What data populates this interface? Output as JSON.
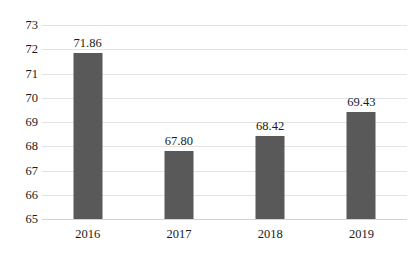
{
  "chart_data": {
    "type": "bar",
    "title": "",
    "subtitle": "",
    "xlabel": "",
    "ylabel": "",
    "categories": [
      "2016",
      "2017",
      "2018",
      "2019"
    ],
    "values": [
      71.86,
      67.8,
      68.42,
      69.43
    ],
    "data_labels": [
      "71.86",
      "67.80",
      "68.42",
      "69.43"
    ],
    "ylim": [
      65,
      73
    ],
    "yticks": [
      73,
      72,
      71,
      70,
      69,
      68,
      67,
      66,
      65
    ],
    "ytick_labels": [
      "73",
      "72",
      "71",
      "70",
      "69",
      "68",
      "67",
      "66",
      "65"
    ],
    "grid": true,
    "grid_axis": "y",
    "legend": false,
    "legend_position": "none",
    "series": [
      {
        "name": "",
        "values": [
          71.86,
          67.8,
          68.42,
          69.43
        ]
      }
    ],
    "colors": {
      "bar": "#595959",
      "gridline": "#e3e3e3",
      "baseline": "#d2d2d2",
      "background": "#ffffff",
      "text": "#1a1a1a"
    }
  }
}
